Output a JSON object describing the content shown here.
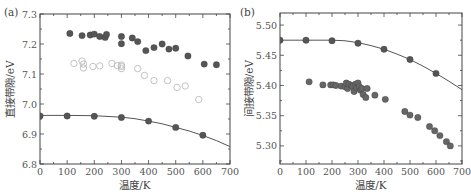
{
  "chart_data": [
    {
      "type": "scatter",
      "panel_label": "(a)",
      "xlabel": "温度/K",
      "ylabel": "直接带隙/eV",
      "xlim": [
        0,
        700
      ],
      "ylim": [
        6.8,
        7.3
      ],
      "xticks": [
        0,
        100,
        200,
        300,
        400,
        500,
        600,
        700
      ],
      "xtick_labels": [
        "0",
        "100",
        "200",
        "300",
        "400",
        "500",
        "600",
        "700"
      ],
      "yticks": [
        6.8,
        6.9,
        7.0,
        7.1,
        7.2,
        7.3
      ],
      "ytick_labels": [
        "6.8",
        "6.9",
        "7.0",
        "7.1",
        "7.2",
        "7.3"
      ],
      "grid": false,
      "series": [
        {
          "name": "experiment-filled",
          "marker": "filled-circle",
          "color": "#555555",
          "points": [
            [
              110,
              7.235
            ],
            [
              155,
              7.228
            ],
            [
              185,
              7.23
            ],
            [
              200,
              7.233
            ],
            [
              220,
              7.225
            ],
            [
              240,
              7.222
            ],
            [
              245,
              7.232
            ],
            [
              300,
              7.225
            ],
            [
              300,
              7.201
            ],
            [
              340,
              7.22
            ],
            [
              360,
              7.208
            ],
            [
              390,
              7.178
            ],
            [
              420,
              7.188
            ],
            [
              450,
              7.2
            ],
            [
              475,
              7.183
            ],
            [
              500,
              7.186
            ],
            [
              545,
              7.16
            ],
            [
              605,
              7.133
            ],
            [
              650,
              7.131
            ]
          ]
        },
        {
          "name": "experiment-open",
          "marker": "open-circle",
          "color": "#bbbbbb",
          "points": [
            [
              125,
              7.135
            ],
            [
              155,
              7.143
            ],
            [
              160,
              7.12
            ],
            [
              160,
              7.133
            ],
            [
              195,
              7.125
            ],
            [
              220,
              7.127
            ],
            [
              265,
              7.135
            ],
            [
              285,
              7.128
            ],
            [
              300,
              7.118
            ],
            [
              300,
              7.13
            ],
            [
              300,
              7.125
            ],
            [
              360,
              7.118
            ],
            [
              385,
              7.095
            ],
            [
              420,
              7.078
            ],
            [
              470,
              7.078
            ],
            [
              505,
              7.055
            ],
            [
              535,
              7.06
            ],
            [
              585,
              7.015
            ]
          ]
        },
        {
          "name": "calculated",
          "marker": "filled-circle",
          "color": "#555555",
          "points": [
            [
              0,
              6.96
            ],
            [
              100,
              6.96
            ],
            [
              200,
              6.959
            ],
            [
              300,
              6.955
            ],
            [
              400,
              6.943
            ],
            [
              500,
              6.922
            ],
            [
              600,
              6.896
            ]
          ]
        },
        {
          "name": "fit-curve",
          "marker": "line",
          "color": "#555555",
          "points": [
            [
              0,
              6.962
            ],
            [
              100,
              6.962
            ],
            [
              200,
              6.961
            ],
            [
              300,
              6.956
            ],
            [
              350,
              6.951
            ],
            [
              400,
              6.943
            ],
            [
              450,
              6.934
            ],
            [
              500,
              6.922
            ],
            [
              550,
              6.91
            ],
            [
              600,
              6.895
            ],
            [
              650,
              6.878
            ],
            [
              700,
              6.858
            ]
          ]
        }
      ]
    },
    {
      "type": "scatter",
      "panel_label": "(b)",
      "xlabel": "温度/K",
      "ylabel": "间接带隙/eV",
      "xlim": [
        0,
        700
      ],
      "ylim": [
        5.27,
        5.52
      ],
      "xticks": [
        0,
        100,
        200,
        300,
        400,
        500,
        600,
        700
      ],
      "xtick_labels": [
        "0",
        "100",
        "200",
        "300",
        "400",
        "500",
        "600",
        "700"
      ],
      "yticks": [
        5.3,
        5.35,
        5.4,
        5.45,
        5.5
      ],
      "ytick_labels": [
        "5.30",
        "5.35",
        "5.40",
        "5.45",
        "5.50"
      ],
      "grid": false,
      "series": [
        {
          "name": "calculated",
          "marker": "filled-circle",
          "color": "#555555",
          "points": [
            [
              0,
              5.475
            ],
            [
              100,
              5.475
            ],
            [
              200,
              5.474
            ],
            [
              300,
              5.47
            ],
            [
              400,
              5.46
            ],
            [
              500,
              5.443
            ],
            [
              600,
              5.42
            ]
          ]
        },
        {
          "name": "fit-curve",
          "marker": "line",
          "color": "#555555",
          "points": [
            [
              0,
              5.475
            ],
            [
              100,
              5.475
            ],
            [
              200,
              5.475
            ],
            [
              250,
              5.474
            ],
            [
              300,
              5.471
            ],
            [
              350,
              5.466
            ],
            [
              400,
              5.46
            ],
            [
              450,
              5.452
            ],
            [
              500,
              5.443
            ],
            [
              550,
              5.432
            ],
            [
              600,
              5.42
            ],
            [
              650,
              5.407
            ],
            [
              700,
              5.393
            ]
          ]
        },
        {
          "name": "experiment",
          "marker": "filled-circle",
          "color": "#666666",
          "points": [
            [
              112,
              5.406
            ],
            [
              165,
              5.401
            ],
            [
              195,
              5.401
            ],
            [
              205,
              5.401
            ],
            [
              215,
              5.4
            ],
            [
              235,
              5.399
            ],
            [
              250,
              5.398
            ],
            [
              255,
              5.404
            ],
            [
              260,
              5.395
            ],
            [
              265,
              5.402
            ],
            [
              275,
              5.4
            ],
            [
              280,
              5.398
            ],
            [
              285,
              5.39
            ],
            [
              290,
              5.402
            ],
            [
              295,
              5.396
            ],
            [
              300,
              5.404
            ],
            [
              305,
              5.398
            ],
            [
              310,
              5.392
            ],
            [
              315,
              5.395
            ],
            [
              320,
              5.385
            ],
            [
              330,
              5.38
            ],
            [
              335,
              5.395
            ],
            [
              365,
              5.384
            ],
            [
              405,
              5.377
            ],
            [
              480,
              5.357
            ],
            [
              500,
              5.351
            ],
            [
              530,
              5.347
            ],
            [
              575,
              5.332
            ],
            [
              595,
              5.325
            ],
            [
              615,
              5.317
            ],
            [
              640,
              5.307
            ],
            [
              655,
              5.3
            ]
          ]
        }
      ]
    }
  ]
}
